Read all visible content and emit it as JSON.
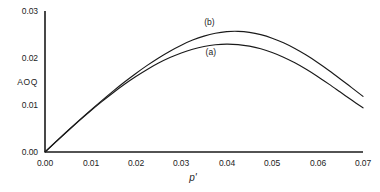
{
  "chart_data": {
    "type": "line",
    "title": "",
    "xlabel": "p'",
    "ylabel": "AOQ",
    "xlim": [
      0.0,
      0.07
    ],
    "ylim": [
      0.0,
      0.03
    ],
    "grid": false,
    "legend_position": "inline-annotations",
    "x_tick_labels": [
      "0.00",
      "0.01",
      "0.02",
      "0.03",
      "0.04",
      "0.05",
      "0.06",
      "0.07"
    ],
    "x_tick_values": [
      0.0,
      0.01,
      0.02,
      0.03,
      0.04,
      0.05,
      0.06,
      0.07
    ],
    "y_tick_labels": [
      "0.00",
      "0.01",
      "0.02",
      "0.03"
    ],
    "y_tick_values": [
      0.0,
      0.01,
      0.02,
      0.03
    ],
    "series": [
      {
        "name": "(a)",
        "label": "(a)",
        "color": "#1a1a1a",
        "annotation_x": 0.0365,
        "annotation_y": 0.0212,
        "x": [
          0.0,
          0.0025,
          0.005,
          0.0075,
          0.01,
          0.0125,
          0.015,
          0.0175,
          0.02,
          0.0225,
          0.025,
          0.0275,
          0.03,
          0.0325,
          0.035,
          0.0375,
          0.04,
          0.0425,
          0.045,
          0.0475,
          0.05,
          0.0525,
          0.055,
          0.0575,
          0.06,
          0.0625,
          0.065,
          0.0675,
          0.07
        ],
        "y": [
          0.0,
          0.00225,
          0.00447,
          0.00663,
          0.00872,
          0.01072,
          0.01262,
          0.01441,
          0.01606,
          0.01757,
          0.01892,
          0.02009,
          0.02108,
          0.02187,
          0.02245,
          0.02281,
          0.02295,
          0.02285,
          0.02252,
          0.02196,
          0.02117,
          0.02017,
          0.01897,
          0.01759,
          0.01607,
          0.01444,
          0.01275,
          0.01105,
          0.0094
        ]
      },
      {
        "name": "(b)",
        "label": "(b)",
        "color": "#1a1a1a",
        "annotation_x": 0.0362,
        "annotation_y": 0.0276,
        "x": [
          0.0,
          0.0025,
          0.005,
          0.0075,
          0.01,
          0.0125,
          0.015,
          0.0175,
          0.02,
          0.0225,
          0.025,
          0.0275,
          0.03,
          0.0325,
          0.035,
          0.0375,
          0.04,
          0.0425,
          0.045,
          0.0475,
          0.05,
          0.0525,
          0.055,
          0.0575,
          0.06,
          0.0625,
          0.065,
          0.0675,
          0.07
        ],
        "y": [
          0.0,
          0.00228,
          0.00452,
          0.00672,
          0.00886,
          0.01094,
          0.01295,
          0.01488,
          0.01671,
          0.01843,
          0.02002,
          0.02146,
          0.02273,
          0.02381,
          0.02466,
          0.02527,
          0.02561,
          0.02567,
          0.02546,
          0.02497,
          0.02422,
          0.02323,
          0.02202,
          0.02062,
          0.01905,
          0.01735,
          0.01555,
          0.0137,
          0.01184
        ]
      }
    ]
  }
}
